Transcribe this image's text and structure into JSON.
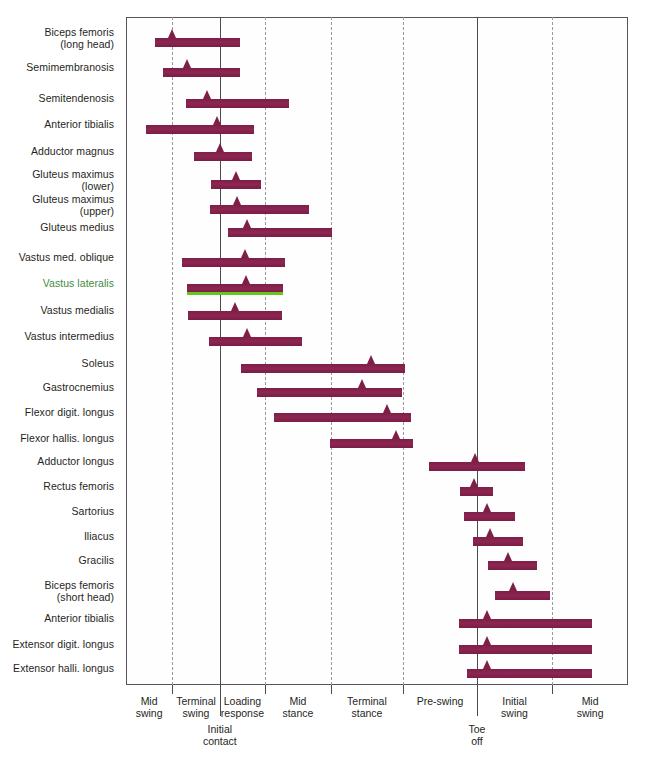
{
  "chart_data": {
    "type": "bar",
    "title": "",
    "subtitle": "",
    "xlabel": "Gait cycle phase",
    "ylabel": "Muscle",
    "xlim": [
      0,
      100
    ],
    "grid": true,
    "legend_position": "none",
    "orientation": "horizontal-gantt",
    "bar_color": "#822049",
    "highlight_color": "#64c81e",
    "highlight_label_color": "#3f8c3f",
    "axis_color": "#4a4a50",
    "gridline_color": "#9a9aa2",
    "note": "Horizontal timing bars show EMG activity window of each muscle across the gait cycle; the small triangle marks the peak activity instant. x values are percent of the plot width (0 = left frame edge, 100 = right frame edge).",
    "x_gridlines": [
      {
        "pos": 9.2,
        "style": "dashed",
        "event": ""
      },
      {
        "pos": 18.7,
        "style": "solid",
        "event": "Initial contact"
      },
      {
        "pos": 27.7,
        "style": "dashed",
        "event": ""
      },
      {
        "pos": 40.8,
        "style": "dashed",
        "event": ""
      },
      {
        "pos": 55.2,
        "style": "dashed",
        "event": ""
      },
      {
        "pos": 69.9,
        "style": "solid",
        "event": "Toe off"
      },
      {
        "pos": 84.9,
        "style": "dashed",
        "event": ""
      }
    ],
    "phases": [
      {
        "label": "Mid\nswing",
        "start": 0.0,
        "end": 9.2
      },
      {
        "label": "Terminal\nswing",
        "start": 9.2,
        "end": 18.7
      },
      {
        "label": "Loading\nresponse",
        "start": 18.7,
        "end": 27.7
      },
      {
        "label": "Mid\nstance",
        "start": 27.7,
        "end": 40.8
      },
      {
        "label": "Terminal\nstance",
        "start": 40.8,
        "end": 55.2
      },
      {
        "label": "Pre-swing",
        "start": 55.2,
        "end": 69.9
      },
      {
        "label": "Initial\nswing",
        "start": 69.9,
        "end": 84.9
      },
      {
        "label": "Mid\nswing",
        "start": 84.9,
        "end": 100.0
      }
    ],
    "events": [
      {
        "label": "Initial\ncontact",
        "pos": 18.7
      },
      {
        "label": "Toe\noff",
        "pos": 69.9
      }
    ],
    "categories": [
      "Biceps femoris\n(long head)",
      "Semimembranosis",
      "Semitendenosis",
      "Anterior tibialis",
      "Adductor magnus",
      "Gluteus maximus\n(lower)",
      "Gluteus maximus\n(upper)",
      "Gluteus medius",
      "Vastus med. oblique",
      "Vastus lateralis",
      "Vastus medialis",
      "Vastus intermedius",
      "Soleus",
      "Gastrocnemius",
      "Flexor digit. longus",
      "Flexor hallis. longus",
      "Adductor longus",
      "Rectus femoris",
      "Sartorius",
      "Iliacus",
      "Gracilis",
      "Biceps femoris\n(short head)",
      "Anterior tibialis",
      "Extensor digit. longus",
      "Extensor halli. longus"
    ],
    "rows": [
      {
        "muscle": "Biceps femoris\n(long head)",
        "start": 5.8,
        "end": 22.7,
        "peak": 9.2,
        "y": 38,
        "label_y": 33,
        "highlight": false
      },
      {
        "muscle": "Semimembranosis",
        "start": 7.4,
        "end": 22.7,
        "peak": 12.2,
        "y": 68,
        "label_y": 68,
        "highlight": false
      },
      {
        "muscle": "Semitendenosis",
        "start": 12.0,
        "end": 32.5,
        "peak": 16.1,
        "y": 99,
        "label_y": 99,
        "highlight": false
      },
      {
        "muscle": "Anterior tibialis",
        "start": 4.0,
        "end": 25.5,
        "peak": 18.1,
        "y": 125,
        "label_y": 125,
        "highlight": false
      },
      {
        "muscle": "Adductor magnus",
        "start": 13.5,
        "end": 25.1,
        "peak": 18.7,
        "y": 152,
        "label_y": 152,
        "highlight": false
      },
      {
        "muscle": "Gluteus maximus\n(lower)",
        "start": 16.9,
        "end": 26.9,
        "peak": 21.9,
        "y": 180,
        "label_y": 175,
        "highlight": false
      },
      {
        "muscle": "Gluteus maximus\n(upper)",
        "start": 16.7,
        "end": 36.5,
        "peak": 22.1,
        "y": 205,
        "label_y": 200,
        "highlight": false
      },
      {
        "muscle": "Gluteus medius",
        "start": 20.3,
        "end": 41.0,
        "peak": 24.1,
        "y": 228,
        "label_y": 228,
        "highlight": false
      },
      {
        "muscle": "Vastus med. oblique",
        "start": 11.2,
        "end": 31.7,
        "peak": 23.7,
        "y": 258,
        "label_y": 258,
        "highlight": false
      },
      {
        "muscle": "Vastus lateralis",
        "start": 12.2,
        "end": 31.3,
        "peak": 23.9,
        "y": 284,
        "label_y": 284,
        "highlight": true
      },
      {
        "muscle": "Vastus medialis",
        "start": 12.4,
        "end": 31.1,
        "peak": 21.7,
        "y": 311,
        "label_y": 311,
        "highlight": false
      },
      {
        "muscle": "Vastus intermedius",
        "start": 16.5,
        "end": 35.1,
        "peak": 24.1,
        "y": 337,
        "label_y": 337,
        "highlight": false
      },
      {
        "muscle": "Soleus",
        "start": 22.9,
        "end": 55.6,
        "peak": 48.8,
        "y": 364,
        "label_y": 364,
        "highlight": false
      },
      {
        "muscle": "Gastrocnemius",
        "start": 26.1,
        "end": 55.0,
        "peak": 47.0,
        "y": 388,
        "label_y": 388,
        "highlight": false
      },
      {
        "muscle": "Flexor digit. longus",
        "start": 29.5,
        "end": 56.8,
        "peak": 52.0,
        "y": 413,
        "label_y": 413,
        "highlight": false
      },
      {
        "muscle": "Flexor hallis. longus",
        "start": 40.6,
        "end": 57.2,
        "peak": 53.8,
        "y": 439,
        "label_y": 439,
        "highlight": false
      },
      {
        "muscle": "Adductor longus",
        "start": 60.4,
        "end": 79.5,
        "peak": 69.5,
        "y": 462,
        "label_y": 462,
        "highlight": false
      },
      {
        "muscle": "Rectus femoris",
        "start": 66.5,
        "end": 73.1,
        "peak": 69.3,
        "y": 487,
        "label_y": 487,
        "highlight": false
      },
      {
        "muscle": "Sartorius",
        "start": 67.3,
        "end": 77.5,
        "peak": 71.9,
        "y": 512,
        "label_y": 512,
        "highlight": false
      },
      {
        "muscle": "Iliacus",
        "start": 69.1,
        "end": 79.1,
        "peak": 72.5,
        "y": 537,
        "label_y": 537,
        "highlight": false
      },
      {
        "muscle": "Gracilis",
        "start": 72.1,
        "end": 81.9,
        "peak": 76.1,
        "y": 561,
        "label_y": 561,
        "highlight": false
      },
      {
        "muscle": "Biceps femoris\n(short head)",
        "start": 73.5,
        "end": 84.5,
        "peak": 77.1,
        "y": 591,
        "label_y": 586,
        "highlight": false
      },
      {
        "muscle": "Anterior tibialis",
        "start": 66.3,
        "end": 92.8,
        "peak": 71.9,
        "y": 619,
        "label_y": 619,
        "highlight": false
      },
      {
        "muscle": "Extensor digit. longus",
        "start": 66.3,
        "end": 92.8,
        "peak": 71.9,
        "y": 645,
        "label_y": 645,
        "highlight": false
      },
      {
        "muscle": "Extensor halli. longus",
        "start": 67.9,
        "end": 92.8,
        "peak": 71.9,
        "y": 669,
        "label_y": 669,
        "highlight": false
      }
    ]
  }
}
